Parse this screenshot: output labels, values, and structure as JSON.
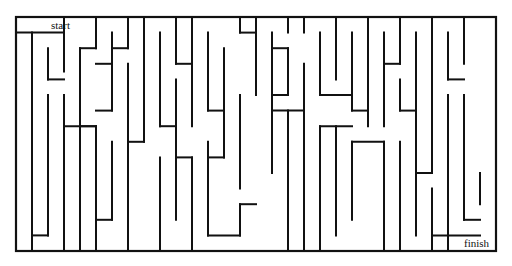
{
  "maze": {
    "start_label": "start",
    "finish_label": "finish",
    "wall_color": "#111111",
    "background": "#ffffff",
    "grid": {
      "origin_x": 16,
      "origin_y": 17,
      "cell_w": 16,
      "cell_h": 15.6,
      "cols": 30,
      "rows": 15
    },
    "frame": {
      "x1": 0,
      "y1": 0,
      "x2": 30,
      "y2": 15
    },
    "walls": [
      [
        0,
        1,
        3,
        1
      ],
      [
        3,
        0,
        3,
        1
      ],
      [
        3,
        1,
        3,
        3.5
      ],
      [
        1,
        1,
        1,
        10
      ],
      [
        1,
        4,
        1,
        15
      ],
      [
        2,
        2,
        2,
        4
      ],
      [
        2,
        4,
        3,
        4
      ],
      [
        2,
        5,
        2,
        14
      ],
      [
        2,
        14,
        1,
        14
      ],
      [
        1,
        14,
        1,
        15
      ],
      [
        3,
        0,
        3,
        1
      ],
      [
        5,
        0,
        5,
        2
      ],
      [
        5,
        2,
        4,
        2
      ],
      [
        4,
        2,
        4,
        6
      ],
      [
        4,
        6,
        4,
        7
      ],
      [
        6,
        1,
        6,
        6
      ],
      [
        6,
        6,
        5,
        6
      ],
      [
        5,
        3,
        6,
        3
      ],
      [
        7,
        0,
        7,
        2
      ],
      [
        7,
        2,
        6,
        2
      ],
      [
        7,
        3,
        7,
        6
      ],
      [
        5,
        7,
        4,
        7
      ],
      [
        4,
        7,
        4,
        15
      ],
      [
        3,
        5,
        3,
        15
      ],
      [
        3,
        7,
        5,
        7
      ],
      [
        5,
        7,
        5,
        14
      ],
      [
        5,
        9,
        5,
        15
      ],
      [
        6,
        8,
        6,
        13
      ],
      [
        6,
        13,
        5,
        13
      ],
      [
        8,
        0,
        8,
        8
      ],
      [
        8,
        8,
        7,
        8
      ],
      [
        7,
        4,
        7,
        15
      ],
      [
        9,
        1,
        9,
        7
      ],
      [
        9,
        7,
        10,
        7
      ],
      [
        9,
        9,
        9,
        15
      ],
      [
        10,
        0,
        10,
        1
      ],
      [
        10,
        1,
        10,
        3
      ],
      [
        10,
        3,
        11,
        3
      ],
      [
        11,
        0,
        11,
        7
      ],
      [
        10,
        4,
        10,
        13
      ],
      [
        10,
        9,
        11,
        9
      ],
      [
        11,
        9,
        11,
        15
      ],
      [
        12,
        1,
        12,
        6
      ],
      [
        12,
        6,
        13,
        6
      ],
      [
        13,
        2,
        13,
        9
      ],
      [
        13,
        9,
        12,
        9
      ],
      [
        12,
        8,
        12,
        14
      ],
      [
        12,
        14,
        14,
        14
      ],
      [
        14,
        14,
        14,
        12
      ],
      [
        14,
        12,
        15,
        12
      ],
      [
        14,
        0,
        14,
        1
      ],
      [
        14,
        1,
        15,
        1
      ],
      [
        15,
        0,
        15,
        5
      ],
      [
        14,
        5,
        14,
        11
      ],
      [
        16,
        1,
        16,
        10
      ],
      [
        16,
        2,
        17,
        2
      ],
      [
        17,
        2,
        17,
        5
      ],
      [
        16,
        5,
        17,
        5
      ],
      [
        17,
        0,
        17,
        1
      ],
      [
        17,
        6,
        17,
        15
      ],
      [
        16,
        6,
        18,
        6
      ],
      [
        18,
        6,
        18,
        15
      ],
      [
        18,
        0,
        18,
        1
      ],
      [
        18,
        3,
        18,
        9
      ],
      [
        19,
        1,
        19,
        5
      ],
      [
        19,
        5,
        21,
        5
      ],
      [
        20,
        0,
        20,
        4
      ],
      [
        21,
        1,
        21,
        6
      ],
      [
        21,
        6,
        22,
        6
      ],
      [
        22,
        0,
        22,
        7
      ],
      [
        19,
        7,
        19,
        15
      ],
      [
        20,
        7,
        20,
        14
      ],
      [
        19,
        7,
        21,
        7
      ],
      [
        21,
        8,
        21,
        13
      ],
      [
        21,
        8,
        23,
        8
      ],
      [
        23,
        8,
        23,
        15
      ],
      [
        23,
        1,
        23,
        7
      ],
      [
        23,
        3,
        24,
        3
      ],
      [
        24,
        0,
        24,
        3
      ],
      [
        24,
        4,
        24,
        6
      ],
      [
        24,
        6,
        25,
        6
      ],
      [
        25,
        1,
        25,
        14
      ],
      [
        24,
        8,
        24,
        15
      ],
      [
        26,
        0,
        26,
        10
      ],
      [
        26,
        10,
        25,
        10
      ],
      [
        27,
        1,
        27,
        4
      ],
      [
        27,
        4,
        28,
        4
      ],
      [
        28,
        0,
        28,
        3
      ],
      [
        27,
        5,
        27,
        15
      ],
      [
        28,
        5,
        28,
        13
      ],
      [
        28,
        13,
        29,
        13
      ],
      [
        29,
        12,
        29,
        10
      ],
      [
        26,
        11,
        26,
        15
      ],
      [
        26,
        14,
        29,
        14
      ]
    ]
  }
}
